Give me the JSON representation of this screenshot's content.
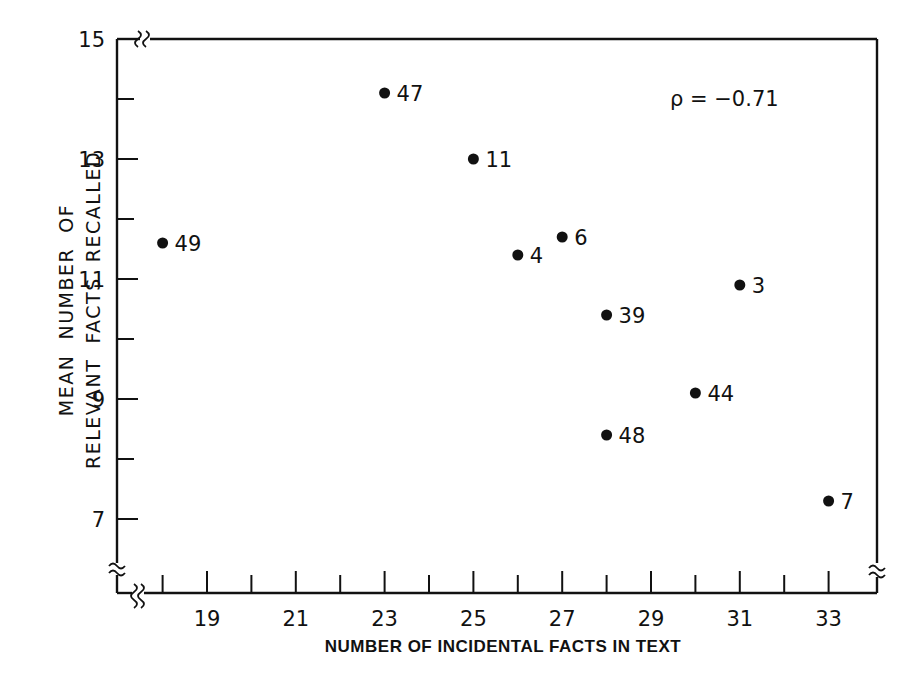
{
  "chart_data": {
    "type": "scatter",
    "title": "",
    "xlabel": "NUMBER OF INCIDENTAL FACTS IN TEXT",
    "ylabel": [
      "MEAN NUMBER OF",
      "RELEVANT FACTS RECALLED"
    ],
    "xlim": [
      17,
      34
    ],
    "ylim": [
      5.8,
      15
    ],
    "x_ticks_major": [
      19,
      21,
      23,
      25,
      27,
      29,
      31,
      33
    ],
    "x_ticks_minor": [
      18,
      20,
      22,
      24,
      26,
      28,
      30,
      32
    ],
    "y_ticks_major": [
      7,
      9,
      11,
      13,
      15
    ],
    "y_ticks_minor": [
      8,
      10,
      12,
      14
    ],
    "axis_breaks": true,
    "grid": false,
    "legend": null,
    "annotation": "ρ = −0.71",
    "points": [
      {
        "label": "49",
        "x": 18,
        "y": 11.6
      },
      {
        "label": "47",
        "x": 23,
        "y": 14.1
      },
      {
        "label": "11",
        "x": 25,
        "y": 13.0
      },
      {
        "label": "4",
        "x": 26,
        "y": 11.4
      },
      {
        "label": "6",
        "x": 27,
        "y": 11.7
      },
      {
        "label": "3",
        "x": 31,
        "y": 10.9
      },
      {
        "label": "39",
        "x": 28,
        "y": 10.4
      },
      {
        "label": "44",
        "x": 30,
        "y": 9.1
      },
      {
        "label": "48",
        "x": 28,
        "y": 8.4
      },
      {
        "label": "7",
        "x": 33,
        "y": 7.3
      }
    ]
  },
  "labels": {
    "xlabel": "NUMBER OF INCIDENTAL FACTS IN TEXT",
    "ylabel_line1": "MEAN  NUMBER  OF",
    "ylabel_line2": "RELEVANT  FACTS  RECALLED",
    "annotation": "ρ = −0.71"
  },
  "colors": {
    "ink": "#111111",
    "background": "#ffffff"
  }
}
